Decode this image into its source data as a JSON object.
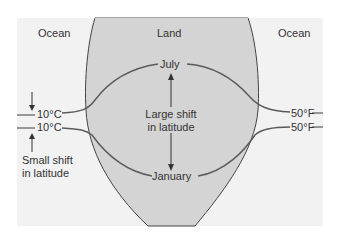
{
  "diagram": {
    "regions": {
      "ocean_left": "Ocean",
      "land": "Land",
      "ocean_right": "Ocean"
    },
    "isotherms": {
      "july_label": "July",
      "january_label": "January",
      "left_top_temp": "10°C",
      "left_bottom_temp": "10°C",
      "right_top_temp": "50°F",
      "right_bottom_temp": "50°F"
    },
    "annotations": {
      "large_shift_line1": "Large shift",
      "large_shift_line2": "in latitude",
      "small_shift_line1": "Small shift",
      "small_shift_line2": "in latitude"
    },
    "colors": {
      "ocean": "#f2f2f2",
      "land": "#d4d4d4",
      "line": "#5a5a5a",
      "coast": "#444444"
    }
  }
}
